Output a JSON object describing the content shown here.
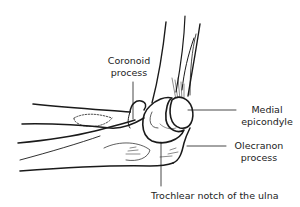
{
  "diagram": {
    "labels": {
      "coronoid": {
        "line1": "Coronoid",
        "line2": "process"
      },
      "medial": {
        "line1": "Medial",
        "line2": "epicondyle"
      },
      "olecranon": {
        "line1": "Olecranon",
        "line2": "process"
      },
      "trochlear": {
        "text": "Trochlear notch of the ulna"
      }
    },
    "colors": {
      "ink": "#1a1a1a",
      "background": "#ffffff"
    }
  }
}
